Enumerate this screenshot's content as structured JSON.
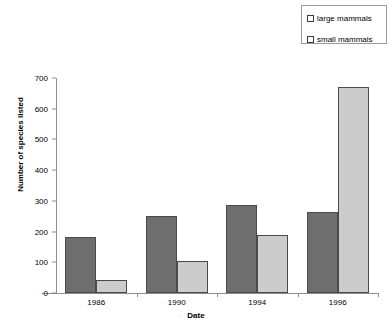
{
  "chart_data": {
    "type": "bar",
    "title": "",
    "xlabel": "Date",
    "ylabel": "Number of species listed",
    "categories": [
      "1986",
      "1990",
      "1994",
      "1996"
    ],
    "series": [
      {
        "name": "large mammals",
        "color": "#6e6e6e",
        "values": [
          182,
          250,
          285,
          264
        ]
      },
      {
        "name": "small mammals",
        "color": "#cccccc",
        "values": [
          42,
          105,
          190,
          670
        ]
      }
    ],
    "ylim": [
      0,
      700
    ],
    "yticks": [
      0,
      100,
      200,
      300,
      400,
      500,
      600,
      700
    ],
    "ytick_labels": [
      "0",
      "100",
      "200",
      "300",
      "400",
      "500",
      "600",
      "700"
    ],
    "grid": false,
    "legend_position": "top-right"
  },
  "legend": {
    "items": [
      {
        "label": "large mammals",
        "swatch": "#6e6e6e"
      },
      {
        "label": "small mammals",
        "swatch": "#cccccc"
      }
    ]
  }
}
